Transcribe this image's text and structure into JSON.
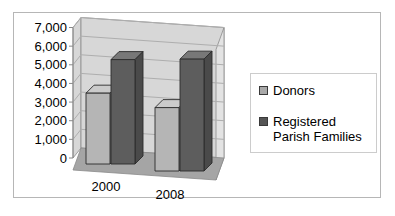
{
  "chart_data": {
    "type": "bar",
    "style": "3d-column",
    "title": "",
    "xlabel": "",
    "ylabel": "",
    "categories": [
      "2000",
      "2008"
    ],
    "series": [
      {
        "name": "Donors",
        "values": [
          3800,
          3400
        ],
        "color_front": "#b5b5b5",
        "color_top": "#cbcbcb",
        "color_side": "#989898",
        "legend_swatch": "#a9a9a9"
      },
      {
        "name": "Registered Parish Families",
        "values": [
          5600,
          6000
        ],
        "color_front": "#5d5d5d",
        "color_top": "#787878",
        "color_side": "#4a4a4a",
        "legend_swatch": "#555555"
      }
    ],
    "ylim": [
      0,
      7000
    ],
    "ytick_step": 1000,
    "ytick_labels": [
      "0",
      "1,000",
      "2,000",
      "3,000",
      "4,000",
      "5,000",
      "6,000",
      "7,000"
    ],
    "grid": true,
    "legend_position": "right",
    "colors": {
      "wall": "#d7d7d7",
      "wall_side": "#e3e3e3",
      "left_wall": "#d7d7d7",
      "floor": "#a5a5a5",
      "gridline": "#aeaeae",
      "outline": "#2b2b2b",
      "axis": "#8a8a8a",
      "text": "#000000",
      "frame_border": "#b6b6b6",
      "legend_border": "#cccccc",
      "background": "#ffffff"
    }
  }
}
